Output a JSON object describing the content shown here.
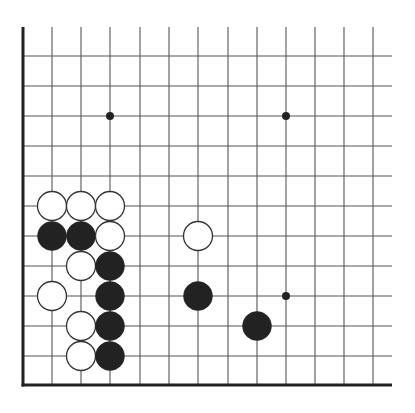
{
  "game": {
    "type": "go",
    "board_size": 19,
    "view": "lower-left corner",
    "colors": {
      "background": "#ffffff",
      "grid_line": "#555555",
      "edge_line": "#222222",
      "black_stone": "#222222",
      "white_stone_fill": "#ffffff",
      "white_stone_stroke": "#333333",
      "star_point": "#222222"
    },
    "geometry": {
      "columns_x": [
        23,
        52,
        81,
        110,
        140,
        169,
        198,
        228,
        257,
        286,
        315,
        344,
        373
      ],
      "rows_y": [
        56,
        86,
        116,
        146,
        176,
        206,
        236,
        266,
        296,
        326,
        356,
        385
      ],
      "grid_top": 27,
      "grid_right": 392,
      "stone_radius": 14.5,
      "star_radius": 4
    },
    "star_points": [
      {
        "col": 3,
        "row": 2
      },
      {
        "col": 9,
        "row": 2
      },
      {
        "col": 9,
        "row": 8
      }
    ],
    "stones": [
      {
        "color": "white",
        "col": 1,
        "row": 5
      },
      {
        "color": "white",
        "col": 2,
        "row": 5
      },
      {
        "color": "white",
        "col": 3,
        "row": 5
      },
      {
        "color": "black",
        "col": 1,
        "row": 6
      },
      {
        "color": "black",
        "col": 2,
        "row": 6
      },
      {
        "color": "white",
        "col": 3,
        "row": 6
      },
      {
        "color": "white",
        "col": 6,
        "row": 6
      },
      {
        "color": "white",
        "col": 2,
        "row": 7
      },
      {
        "color": "black",
        "col": 3,
        "row": 7
      },
      {
        "color": "white",
        "col": 1,
        "row": 8
      },
      {
        "color": "black",
        "col": 3,
        "row": 8
      },
      {
        "color": "black",
        "col": 6,
        "row": 8
      },
      {
        "color": "white",
        "col": 2,
        "row": 9
      },
      {
        "color": "black",
        "col": 3,
        "row": 9
      },
      {
        "color": "black",
        "col": 8,
        "row": 9
      },
      {
        "color": "white",
        "col": 2,
        "row": 10
      },
      {
        "color": "black",
        "col": 3,
        "row": 10
      }
    ]
  }
}
